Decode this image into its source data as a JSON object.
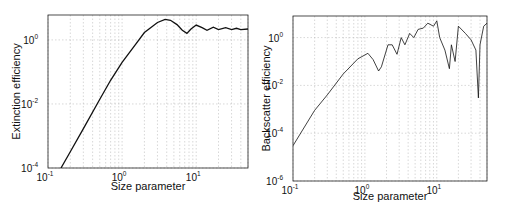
{
  "chart_data": [
    {
      "type": "line",
      "id": "extinction",
      "title": "",
      "xlabel": "Size parameter",
      "ylabel": "Extinction efficiency",
      "xscale": "log",
      "yscale": "log",
      "xlim": [
        0.1,
        50
      ],
      "ylim": [
        0.0001,
        6
      ],
      "grid": true,
      "legend": null,
      "x_ticks": [
        {
          "base": "10",
          "exp": "-1",
          "value": 0.1
        },
        {
          "base": "10",
          "exp": "0",
          "value": 1
        },
        {
          "base": "10",
          "exp": "1",
          "value": 10
        }
      ],
      "y_ticks": [
        {
          "base": "10",
          "exp": "-4",
          "value": 0.0001
        },
        {
          "base": "10",
          "exp": "-2",
          "value": 0.01
        },
        {
          "base": "10",
          "exp": "0",
          "value": 1
        }
      ],
      "series": [
        {
          "name": "Extinction efficiency",
          "x": [
            0.15,
            0.2,
            0.3,
            0.5,
            0.7,
            1.0,
            1.5,
            2.0,
            3.0,
            3.8,
            4.5,
            5.5,
            6.5,
            7.5,
            8.5,
            10,
            12,
            14,
            17,
            20,
            25,
            30,
            35,
            40,
            50
          ],
          "y": [
            0.0001,
            0.00032,
            0.0017,
            0.014,
            0.055,
            0.2,
            0.7,
            1.7,
            3.5,
            4.4,
            4.1,
            3.0,
            2.0,
            1.6,
            2.2,
            2.9,
            2.4,
            2.0,
            2.5,
            2.1,
            2.4,
            2.1,
            2.3,
            2.1,
            2.2
          ]
        }
      ]
    },
    {
      "type": "line",
      "id": "backscatter",
      "title": "",
      "xlabel": "Size parameter",
      "ylabel": "Backscatter efficiency",
      "xscale": "log",
      "yscale": "log",
      "xlim": [
        0.1,
        50
      ],
      "ylim": [
        1e-06,
        8
      ],
      "grid": true,
      "legend": null,
      "x_ticks": [
        {
          "base": "10",
          "exp": "-1",
          "value": 0.1
        },
        {
          "base": "10",
          "exp": "0",
          "value": 1
        },
        {
          "base": "10",
          "exp": "1",
          "value": 10
        }
      ],
      "y_ticks": [
        {
          "base": "10",
          "exp": "-6",
          "value": 1e-06
        },
        {
          "base": "10",
          "exp": "-4",
          "value": 0.0001
        },
        {
          "base": "10",
          "exp": "-2",
          "value": 0.01
        },
        {
          "base": "10",
          "exp": "0",
          "value": 1
        }
      ],
      "series": [
        {
          "name": "Backscatter efficiency",
          "x": [
            0.1,
            0.2,
            0.3,
            0.5,
            0.8,
            1.1,
            1.3,
            1.55,
            1.7,
            2.1,
            2.4,
            2.8,
            3.2,
            3.6,
            4.2,
            4.8,
            5.5,
            6.5,
            7.5,
            9,
            10,
            11,
            13,
            15,
            16,
            18,
            20,
            25,
            30,
            35,
            38,
            40,
            45,
            50
          ],
          "y": [
            3e-05,
            0.0009,
            0.004,
            0.03,
            0.13,
            0.22,
            0.12,
            0.04,
            0.06,
            0.5,
            0.5,
            0.2,
            1.0,
            0.5,
            1.5,
            1.0,
            2.2,
            2.5,
            4.0,
            3.0,
            5.0,
            1.0,
            0.3,
            0.05,
            0.5,
            0.1,
            3.0,
            1.5,
            0.8,
            0.3,
            0.003,
            0.5,
            3.0,
            4.0
          ]
        }
      ]
    }
  ]
}
